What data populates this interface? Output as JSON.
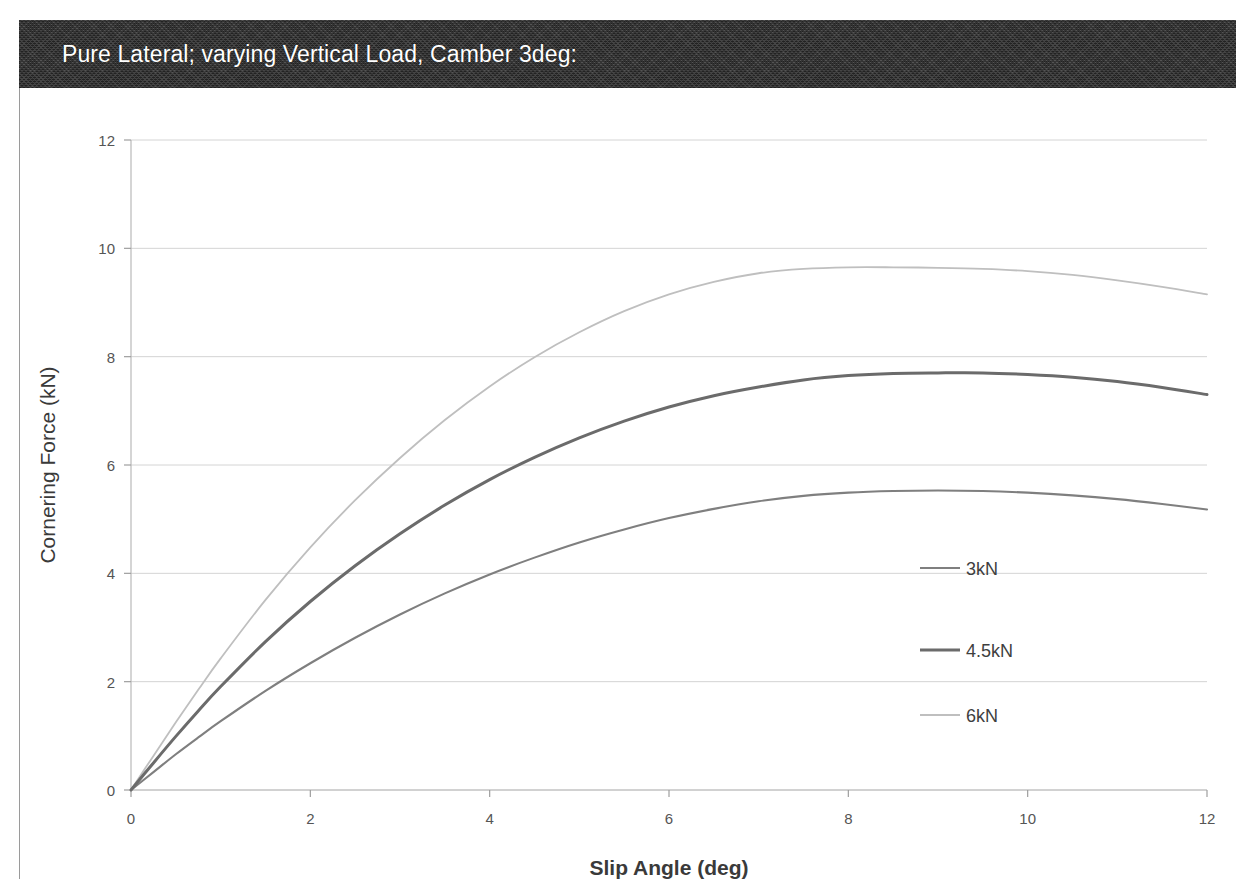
{
  "header": {
    "title": "Pure Lateral; varying Vertical Load, Camber 3deg:",
    "band_color": "#2d2d2d",
    "text_color": "#ffffff"
  },
  "chart_data": {
    "type": "line",
    "title": "Pure Lateral; varying Vertical Load, Camber 3deg:",
    "xlabel": "Slip Angle (deg)",
    "ylabel": "Cornering Force (kN)",
    "xlim": [
      0,
      12
    ],
    "ylim": [
      0,
      12
    ],
    "xticks": [
      0,
      2,
      4,
      6,
      8,
      10,
      12
    ],
    "yticks": [
      0,
      2,
      4,
      6,
      8,
      10,
      12
    ],
    "xtick_labels": [
      "0",
      "2",
      "4",
      "6",
      "8",
      "10",
      "12"
    ],
    "ytick_labels": [
      "0",
      "2",
      "4",
      "6",
      "8",
      "10",
      "12"
    ],
    "grid": true,
    "grid_color": "#d4d4d4",
    "legend_position": "right-inside",
    "x": [
      0,
      0.25,
      0.5,
      0.75,
      1,
      1.5,
      2,
      2.5,
      3,
      3.5,
      4,
      4.5,
      5,
      5.5,
      6,
      6.5,
      7,
      7.5,
      8,
      8.5,
      9,
      9.5,
      10,
      10.5,
      11,
      11.5,
      12
    ],
    "series": [
      {
        "name": "3kN",
        "color": "#7f7f7f",
        "width": 2.1,
        "peak_value": 5.53,
        "peak_at": 9.2,
        "end_value": 5.18,
        "values": [
          0,
          0.33,
          0.66,
          0.97,
          1.27,
          1.83,
          2.34,
          2.81,
          3.24,
          3.63,
          3.98,
          4.29,
          4.57,
          4.81,
          5.02,
          5.19,
          5.33,
          5.43,
          5.49,
          5.52,
          5.53,
          5.52,
          5.49,
          5.44,
          5.37,
          5.28,
          5.18
        ]
      },
      {
        "name": "4.5kN",
        "color": "#6b6b6b",
        "width": 3.0,
        "peak_value": 7.7,
        "peak_at": 9.3,
        "end_value": 7.3,
        "values": [
          0,
          0.5,
          0.99,
          1.46,
          1.91,
          2.74,
          3.48,
          4.14,
          4.73,
          5.26,
          5.73,
          6.14,
          6.5,
          6.81,
          7.07,
          7.28,
          7.44,
          7.57,
          7.65,
          7.69,
          7.7,
          7.7,
          7.67,
          7.62,
          7.54,
          7.43,
          7.3
        ]
      },
      {
        "name": "6kN",
        "color": "#bfbfbf",
        "width": 1.8,
        "peak_value": 9.65,
        "peak_at": 9.5,
        "end_value": 9.15,
        "values": [
          0,
          0.63,
          1.25,
          1.85,
          2.43,
          3.51,
          4.48,
          5.35,
          6.13,
          6.83,
          7.45,
          7.99,
          8.45,
          8.84,
          9.15,
          9.38,
          9.54,
          9.62,
          9.65,
          9.65,
          9.64,
          9.62,
          9.58,
          9.51,
          9.41,
          9.29,
          9.15
        ]
      }
    ],
    "legend_entries": [
      {
        "label": "3kN",
        "color": "#7f7f7f",
        "width": 2.1
      },
      {
        "label": "4.5kN",
        "color": "#6b6b6b",
        "width": 3.0
      },
      {
        "label": "6kN",
        "color": "#bfbfbf",
        "width": 1.8
      }
    ]
  }
}
